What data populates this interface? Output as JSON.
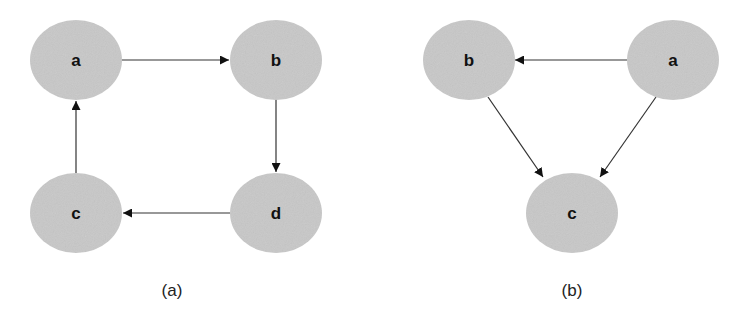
{
  "colors": {
    "node_fill": "#c8c8c8",
    "edge": "#333333",
    "text": "#111111"
  },
  "diagrams": [
    {
      "caption": "(a)",
      "nodes": [
        {
          "id": "a",
          "label": "a"
        },
        {
          "id": "b",
          "label": "b"
        },
        {
          "id": "c",
          "label": "c"
        },
        {
          "id": "d",
          "label": "d"
        }
      ],
      "edges": [
        {
          "from": "a",
          "to": "b"
        },
        {
          "from": "b",
          "to": "d"
        },
        {
          "from": "d",
          "to": "c"
        },
        {
          "from": "c",
          "to": "a"
        }
      ]
    },
    {
      "caption": "(b)",
      "nodes": [
        {
          "id": "b",
          "label": "b"
        },
        {
          "id": "a",
          "label": "a"
        },
        {
          "id": "c",
          "label": "c"
        }
      ],
      "edges": [
        {
          "from": "a",
          "to": "b"
        },
        {
          "from": "b",
          "to": "c"
        },
        {
          "from": "a",
          "to": "c"
        }
      ]
    }
  ]
}
